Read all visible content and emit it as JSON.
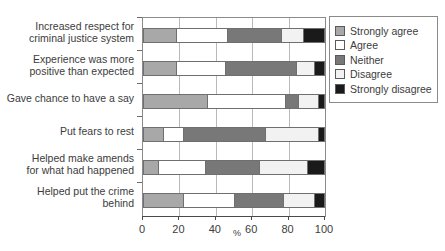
{
  "chart_data": {
    "type": "bar",
    "orientation": "horizontal",
    "stacked": true,
    "title": "",
    "xlabel": "%",
    "ylabel": "",
    "xlim": [
      0,
      100
    ],
    "xticks": [
      0,
      20,
      40,
      60,
      80,
      100
    ],
    "grid": true,
    "legend_position": "right",
    "categories": [
      "Increased respect for\ncriminal justice system",
      "Experience was more\npositive than expected",
      "Gave chance to have a say",
      "Put fears to rest",
      "Helped make amends\nfor what had happened",
      "Helped put the crime\nbehind"
    ],
    "series": [
      {
        "name": "Strongly agree",
        "color": "#a8a8a8",
        "values": [
          18,
          18,
          35,
          11,
          8,
          22
        ]
      },
      {
        "name": "Agree",
        "color": "#ffffff",
        "values": [
          28,
          27,
          43,
          11,
          26,
          28
        ]
      },
      {
        "name": "Neither",
        "color": "#787878",
        "values": [
          30,
          39,
          7,
          45,
          30,
          27
        ]
      },
      {
        "name": "Disagree",
        "color": "#f2f2f2",
        "values": [
          12,
          10,
          11,
          29,
          26,
          17
        ]
      },
      {
        "name": "Strongly disagree",
        "color": "#1a1a1a",
        "values": [
          12,
          6,
          4,
          4,
          10,
          6
        ]
      }
    ]
  },
  "axis": {
    "x_tick_labels": [
      "0",
      "20",
      "40",
      "60",
      "80",
      "100"
    ],
    "x_axis_title": "%"
  },
  "legend": {
    "items": [
      {
        "label": "Strongly agree",
        "color": "#a8a8a8"
      },
      {
        "label": "Agree",
        "color": "#ffffff"
      },
      {
        "label": "Neither",
        "color": "#787878"
      },
      {
        "label": "Disagree",
        "color": "#f2f2f2"
      },
      {
        "label": "Strongly disagree",
        "color": "#1a1a1a"
      }
    ]
  }
}
